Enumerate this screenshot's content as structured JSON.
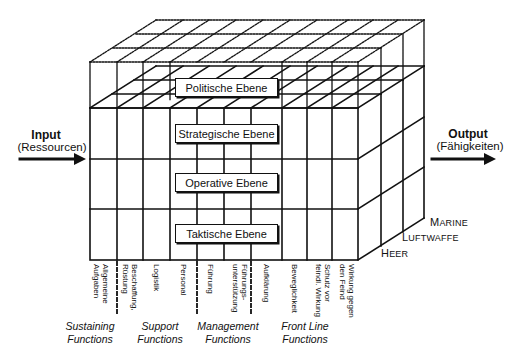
{
  "input": {
    "title": "Input",
    "subtitle": "(Ressourcen)"
  },
  "output": {
    "title": "Output",
    "subtitle": "(Fähigkeiten)"
  },
  "layers": [
    {
      "label": "Politische Ebene"
    },
    {
      "label": "Strategische Ebene"
    },
    {
      "label": "Operative Ebene"
    },
    {
      "label": "Taktische Ebene"
    }
  ],
  "columns": [
    {
      "label": "Allgemeine\nAufgaben"
    },
    {
      "label": "Beschaffung,\nRüstung"
    },
    {
      "label": "Logistik"
    },
    {
      "label": "Personal"
    },
    {
      "label": "Führung"
    },
    {
      "label": "Führungs-\nunterstützung"
    },
    {
      "label": "Aufklärung"
    },
    {
      "label": "Beweglichkeit"
    },
    {
      "label": "Schutz vor\nfeindl. Wirkung"
    },
    {
      "label": "Wirkung gegen\nden Feind"
    }
  ],
  "groups": [
    {
      "line1": "Sustaining",
      "line2": "Functions"
    },
    {
      "line1": "Support",
      "line2": "Functions"
    },
    {
      "line1": "Management",
      "line2": "Functions"
    },
    {
      "line1": "Front Line",
      "line2": "Functions"
    }
  ],
  "branches": [
    {
      "first": "H",
      "rest": "EER"
    },
    {
      "first": "L",
      "rest": "UFTWAFFE"
    },
    {
      "first": "M",
      "rest": "ARINE"
    }
  ]
}
